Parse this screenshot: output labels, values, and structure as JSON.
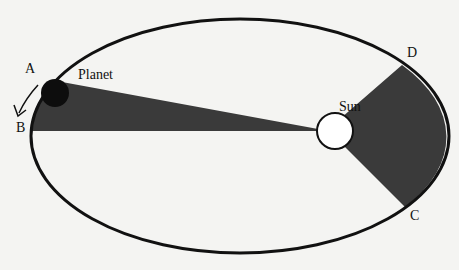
{
  "diagram": {
    "labels": {
      "a": "A",
      "b": "B",
      "c": "C",
      "d": "D",
      "planet": "Planet",
      "sun": "Sun"
    },
    "colors": {
      "background": "#f4f4f2",
      "orbit": "#111111",
      "shaded_area": "#3a3a3a",
      "sun_fill": "#ffffff",
      "planet_fill": "#0d0d0d"
    }
  }
}
